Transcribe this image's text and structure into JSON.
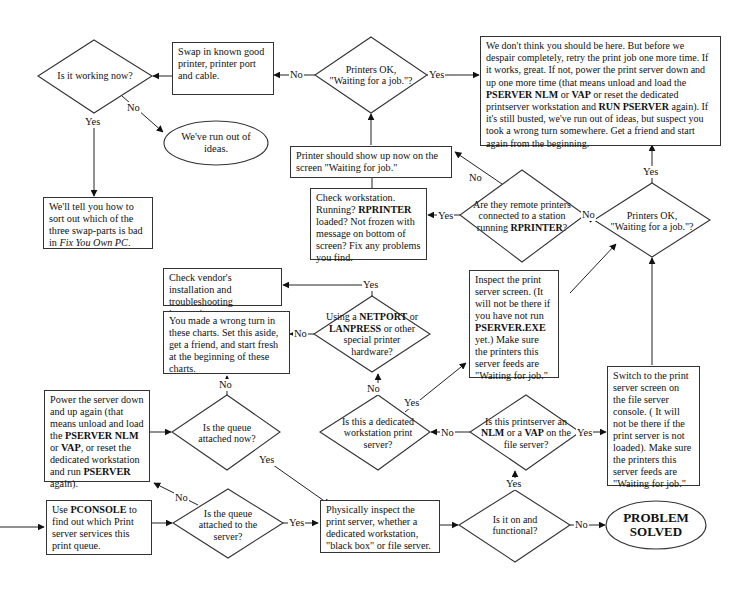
{
  "diagram": {
    "type": "flowchart",
    "nodes": {
      "is_it_working": {
        "shape": "diamond",
        "text": "Is it working now?"
      },
      "swap_parts": {
        "shape": "box",
        "text": "Swap in known good printer, printer port and cable."
      },
      "printers_ok_top": {
        "shape": "diamond",
        "line1": "Printers OK,",
        "line2": "\"Waiting for a job.\"?"
      },
      "dont_think": {
        "shape": "box",
        "p1": "We don't think you should be here.  But before we despair completely, retry the print job one more time. If it works, great.  If not, power the print server down and up one more time (that means unload and load the ",
        "b1": "PSERVER NLM",
        "p2": " or ",
        "b2": "VAP",
        "p3": " or reset the dedicated printserver workstation and ",
        "b3": "RUN PSERVER",
        "p4": " again). If it's still busted, we've run out of ideas,  but suspect you took a wrong turn somewhere.  Get a friend and start again from the beginning."
      },
      "run_out_ideas": {
        "shape": "oval",
        "text": "We've run out of ideas."
      },
      "sort_out": {
        "shape": "box",
        "p1": "We'll tell you how to sort out which of the three swap-parts is bad in ",
        "italic": "Fix You Own PC",
        "p2": "."
      },
      "printer_show_up": {
        "shape": "box",
        "text": "Printer should show up now on the screen \"Waiting for job.\""
      },
      "check_workstation": {
        "shape": "box",
        "p1": "Check workstation. Running?  ",
        "b1": "RPRINTER",
        "p2": " loaded?  Not frozen with message on bottom of screen?  Fix any problems you find."
      },
      "remote_printers": {
        "shape": "diamond",
        "p1": "Are they remote printers connected to a station running ",
        "b1": "RPRINTER",
        "p2": "?"
      },
      "printers_ok_right": {
        "shape": "diamond",
        "line1": "Printers OK,",
        "line2": "\"Waiting for a job.\"?"
      },
      "check_vendor": {
        "shape": "box",
        "text": "Check vendor's installation and troubleshooting instructions."
      },
      "wrong_turn": {
        "shape": "box",
        "text": "You made a wrong turn in these charts.  Set this aside, get a friend, and start fresh at the beginning of these charts."
      },
      "using_netport": {
        "shape": "diamond",
        "p1": "Using a ",
        "b1": "NETPORT",
        "p2": " or ",
        "b2": "LANPRESS",
        "p3": " or other special printer hardware?"
      },
      "inspect_screen": {
        "shape": "box",
        "p1": "Inspect the print server screen.  (It will not be there if you have not run ",
        "b1": "PSERVER.EXE",
        "p2": " yet.)  Make sure the printers this server feeds are \"Waiting for job.\""
      },
      "power_server": {
        "shape": "box",
        "p1": "Power the server down and up again (that means unload and load the ",
        "b1": "PSERVER NLM",
        "p2": " or ",
        "b2": "VAP",
        "p3": ", or reset the dedicated workstation and run ",
        "b3": "PSERVER",
        "p4": " again)."
      },
      "queue_attached_now": {
        "shape": "diamond",
        "text": "Is the queue attached now?"
      },
      "dedicated_ws": {
        "shape": "diamond",
        "text": "Is this a dedicated workstation print server?"
      },
      "nlm_or_vap": {
        "shape": "diamond",
        "p1": "Is this printserver an ",
        "b1": "NLM",
        "p2": " or a ",
        "b2": "VAP",
        "p3": " on the file server?"
      },
      "switch_screen": {
        "shape": "box",
        "text": "Switch to the print server screen on the file server console. ( It will not be there if the print server is not loaded).  Make sure the printers this server feeds are \"Waiting for job.\""
      },
      "use_pconsole": {
        "shape": "box",
        "p1": "Use ",
        "b1": "PCONSOLE",
        "p2": " to find out which Print server services this print queue."
      },
      "queue_attached_server": {
        "shape": "diamond",
        "text": "Is the queue attached to the server?"
      },
      "physically_inspect": {
        "shape": "box",
        "text": "Physically inspect the print server, whether a dedicated workstation, \"black box\" or file server."
      },
      "on_functional": {
        "shape": "diamond",
        "text": "Is it on and functional?"
      },
      "problem_solved": {
        "shape": "oval",
        "line1": "PROBLEM",
        "line2": "SOLVED"
      }
    },
    "labels": {
      "yes": "Yes",
      "no": "No"
    }
  }
}
